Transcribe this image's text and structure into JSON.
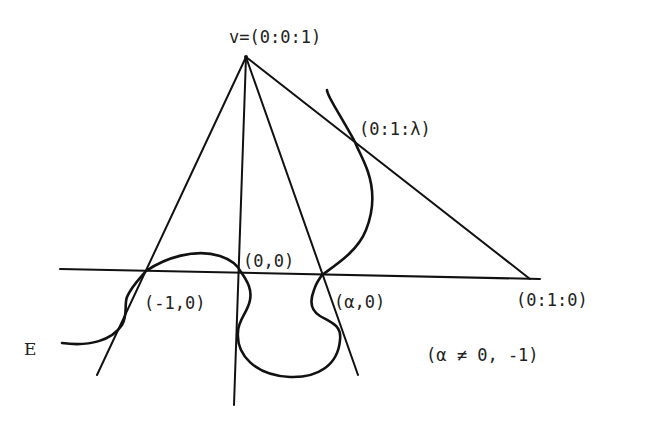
{
  "figure": {
    "type": "projective-geometry-diagram",
    "curve_label": "E",
    "labels": {
      "vertex": "v=(0:0:1)",
      "tangent_point": "(0:1:λ)",
      "origin": "(0,0)",
      "minus_one": "(-1,0)",
      "alpha": "(α,0)",
      "infinity_point": "(0:1:0)",
      "condition": "(α ≠ 0, -1)"
    },
    "colors": {
      "stroke": "#111111",
      "text": "#222222",
      "background": "#ffffff"
    },
    "points": {
      "vertex": [
        246,
        57
      ],
      "minus_one": [
        146,
        271
      ],
      "origin": [
        241,
        272
      ],
      "alpha": [
        322,
        275
      ],
      "tangent_point": [
        355,
        142
      ],
      "infinity_point": [
        530,
        279
      ]
    }
  }
}
